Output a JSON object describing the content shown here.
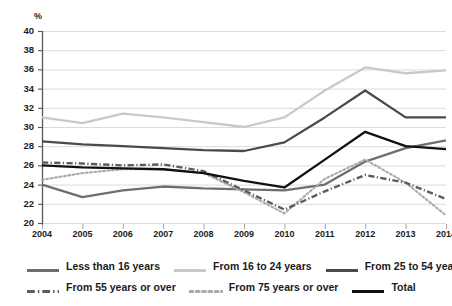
{
  "title": "",
  "axis": {
    "y_unit": "%",
    "y_ticks": [
      "40",
      "38",
      "36",
      "34",
      "32",
      "30",
      "28",
      "26",
      "24",
      "22",
      "20"
    ],
    "x_ticks": [
      "2004",
      "2005",
      "2006",
      "2007",
      "2008",
      "2009",
      "2010",
      "2011",
      "2012",
      "2013",
      "2014"
    ]
  },
  "legend": {
    "row1": [
      {
        "label": "Less than 16 years",
        "style": "solid",
        "color": "#6e6e6e"
      },
      {
        "label": "From 16 to 24 years",
        "style": "solid",
        "color": "#c9c9c9"
      },
      {
        "label": "From 25 to 54 years",
        "style": "solid",
        "color": "#4a4a4a"
      }
    ],
    "row2": [
      {
        "label": "From 55 years or over",
        "style": "dashdot",
        "color": "#5c5c5c"
      },
      {
        "label": "From 75 years or over",
        "style": "dotted",
        "color": "#aaaaaa"
      },
      {
        "label": "Total",
        "style": "solid",
        "color": "#111111"
      }
    ]
  },
  "chart_data": {
    "type": "line",
    "title": "",
    "xlabel": "",
    "ylabel": "%",
    "ylim": [
      20,
      40
    ],
    "ytick_step": 2,
    "grid": true,
    "legend_position": "bottom",
    "x": [
      2004,
      2005,
      2006,
      2007,
      2008,
      2009,
      2010,
      2011,
      2012,
      2013,
      2014
    ],
    "series": [
      {
        "name": "Less than 16 years",
        "style": "solid",
        "color": "#6e6e6e",
        "values": [
          24.0,
          22.7,
          23.4,
          23.8,
          23.6,
          23.5,
          23.4,
          24.0,
          26.4,
          27.8,
          28.6
        ]
      },
      {
        "name": "From 16 to 24 years",
        "style": "solid",
        "color": "#c9c9c9",
        "values": [
          31.0,
          30.4,
          31.4,
          31.0,
          30.5,
          30.0,
          31.0,
          33.8,
          36.2,
          35.6,
          35.9
        ]
      },
      {
        "name": "From 25 to 54 years",
        "style": "solid",
        "color": "#4a4a4a",
        "values": [
          28.5,
          28.2,
          28.0,
          27.8,
          27.6,
          27.5,
          28.4,
          31.0,
          33.8,
          31.0,
          31.0
        ]
      },
      {
        "name": "From 55 years or over",
        "style": "dashdot",
        "color": "#5c5c5c",
        "values": [
          26.3,
          26.2,
          26.0,
          26.1,
          25.4,
          23.4,
          21.4,
          23.3,
          25.0,
          24.2,
          22.5
        ]
      },
      {
        "name": "From 75 years or over",
        "style": "dotted",
        "color": "#aaaaaa",
        "values": [
          24.5,
          25.2,
          25.6,
          25.6,
          25.2,
          23.2,
          21.0,
          24.6,
          26.6,
          24.2,
          20.8
        ]
      },
      {
        "name": "Total",
        "style": "solid",
        "color": "#111111",
        "values": [
          26.0,
          25.8,
          25.7,
          25.6,
          25.2,
          24.4,
          23.7,
          26.6,
          29.5,
          28.0,
          27.7
        ]
      }
    ]
  }
}
